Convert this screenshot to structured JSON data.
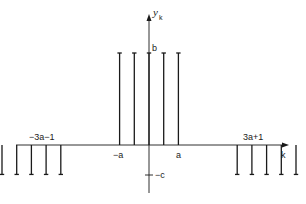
{
  "diagram": {
    "type": "stem-plot",
    "y_axis_label": "y",
    "y_axis_subscript": "k",
    "x_axis_label": "k",
    "level_labels": {
      "positive": "b",
      "negative": "−c"
    },
    "tick_labels": {
      "far_left": "−3a−1",
      "left_inner": "−a",
      "right_inner": "a",
      "far_right": "3a+1"
    },
    "colors": {
      "ink": "#1a1a1a",
      "background": "#ffffff"
    }
  },
  "chart_data": {
    "type": "stem",
    "title": "",
    "xlabel": "k",
    "ylabel": "y_k",
    "levels": {
      "b": 1,
      "c": 0.32
    },
    "stems": [
      {
        "k_index": -10,
        "value": "-c"
      },
      {
        "k_index": -9,
        "value": "-c"
      },
      {
        "k_index": -8,
        "value": "-c"
      },
      {
        "k_index": -7,
        "value": "-c"
      },
      {
        "k_index": -6,
        "value": "-c"
      },
      {
        "k_index": -2,
        "value": "b"
      },
      {
        "k_index": -1,
        "value": "b"
      },
      {
        "k_index": 0,
        "value": "b"
      },
      {
        "k_index": 1,
        "value": "b"
      },
      {
        "k_index": 2,
        "value": "b"
      },
      {
        "k_index": 6,
        "value": "-c"
      },
      {
        "k_index": 7,
        "value": "-c"
      },
      {
        "k_index": 8,
        "value": "-c"
      },
      {
        "k_index": 9,
        "value": "-c"
      },
      {
        "k_index": 10,
        "value": "-c"
      }
    ]
  }
}
